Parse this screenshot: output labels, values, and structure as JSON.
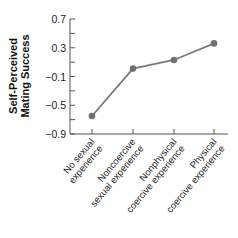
{
  "chart_data": {
    "type": "line",
    "title": "",
    "xlabel": "",
    "ylabel": "Self-Perceived Mating Success",
    "ylabel_lines": [
      "Self-Perceived",
      "Mating Success"
    ],
    "ylim": [
      -0.9,
      0.7
    ],
    "yticks": [
      0.7,
      0.3,
      -0.1,
      -0.5,
      -0.9
    ],
    "ytick_labels": [
      "0.7",
      "0.3",
      "−0.1",
      "−0.5",
      "−0.9"
    ],
    "grid": false,
    "legend": null,
    "categories": [
      "No sexual experience",
      "Noncoercive sexual experience",
      "Nonphysical coercive experience",
      "Physical coercive experience"
    ],
    "category_label_lines": [
      [
        "No sexual",
        "experience"
      ],
      [
        "Noncoercive",
        "sexual experience"
      ],
      [
        "Nonphysical",
        "coercive experience"
      ],
      [
        "Physical",
        "coercive experience"
      ]
    ],
    "series": [
      {
        "name": "Self-Perceived Mating Success",
        "values": [
          -0.65,
          0.01,
          0.13,
          0.36
        ]
      }
    ],
    "colors": {
      "line": "#7a7a7a",
      "marker": "#707070",
      "axis": "#555555"
    }
  }
}
